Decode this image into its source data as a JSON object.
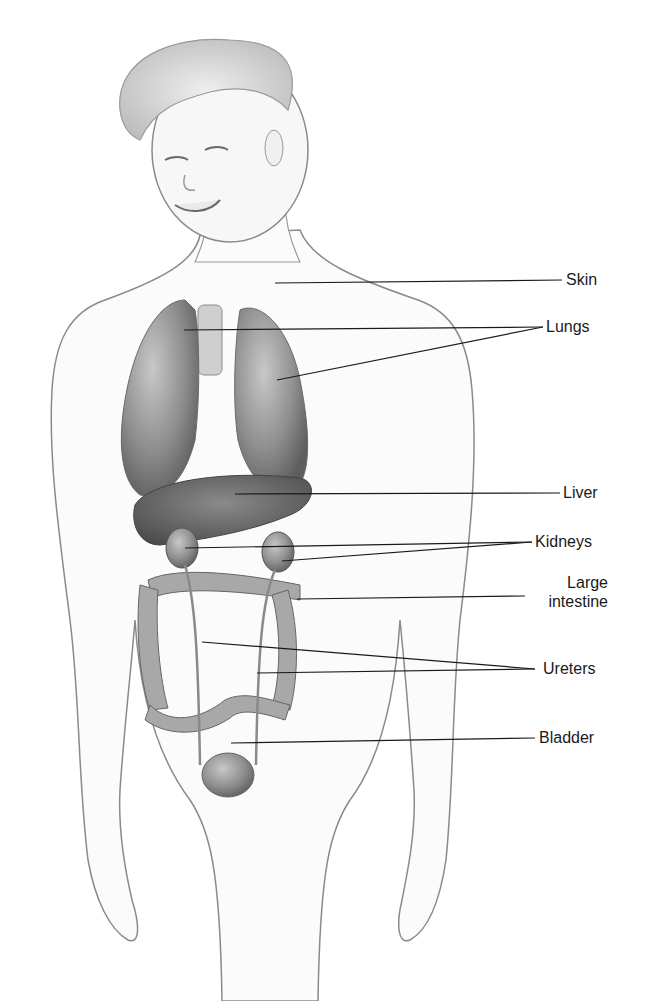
{
  "figure": {
    "labels": [
      {
        "id": "skin",
        "text": "Skin"
      },
      {
        "id": "lungs",
        "text": "Lungs"
      },
      {
        "id": "liver",
        "text": "Liver"
      },
      {
        "id": "kidneys",
        "text": "Kidneys"
      },
      {
        "id": "large-intestine",
        "text": "Large\nintestine",
        "line1": "Large",
        "line2": "intestine"
      },
      {
        "id": "ureters",
        "text": "Ureters"
      },
      {
        "id": "bladder",
        "text": "Bladder"
      }
    ],
    "colors": {
      "line": "#1a1a1a",
      "organ_dark": "#6e6e6e",
      "organ_mid": "#9a9a9a",
      "skin_outline": "#8a8a8a",
      "background": "#ffffff"
    }
  }
}
